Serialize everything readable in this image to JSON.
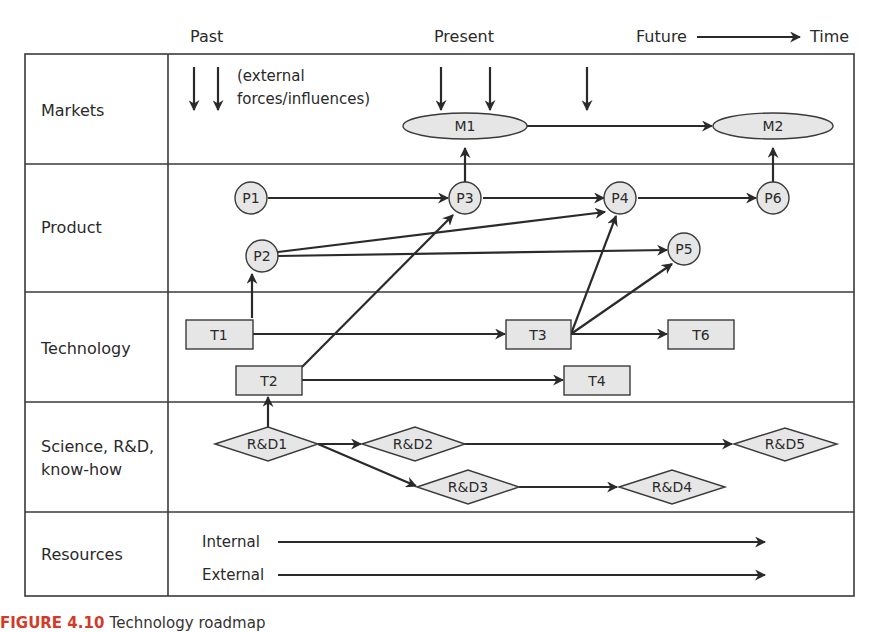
{
  "timeline": {
    "past": "Past",
    "present": "Present",
    "future": "Future",
    "time": "Time"
  },
  "rows": [
    {
      "id": "markets",
      "label": "Markets"
    },
    {
      "id": "product",
      "label": "Product"
    },
    {
      "id": "technology",
      "label": "Technology"
    },
    {
      "id": "science",
      "label_line1": "Science, R&D,",
      "label_line2": "know-how"
    },
    {
      "id": "resources",
      "label": "Resources"
    }
  ],
  "markets": {
    "external_note_line1": "(external",
    "external_note_line2": "forces/influences)",
    "nodes": {
      "m1": "M1",
      "m2": "M2"
    }
  },
  "product": {
    "nodes": {
      "p1": "P1",
      "p2": "P2",
      "p3": "P3",
      "p4": "P4",
      "p5": "P5",
      "p6": "P6"
    }
  },
  "technology": {
    "nodes": {
      "t1": "T1",
      "t2": "T2",
      "t3": "T3",
      "t4": "T4",
      "t6": "T6"
    }
  },
  "science": {
    "nodes": {
      "rd1": "R&D1",
      "rd2": "R&D2",
      "rd3": "R&D3",
      "rd4": "R&D4",
      "rd5": "R&D5"
    }
  },
  "resources": {
    "internal": "Internal",
    "external": "External"
  },
  "caption": {
    "figure_label": "FIGURE 4.10",
    "text": "Technology roadmap"
  },
  "colors": {
    "line": "#2a2a2a",
    "node_fill": "#e6e6e6",
    "grid": "#3a3a3a"
  }
}
